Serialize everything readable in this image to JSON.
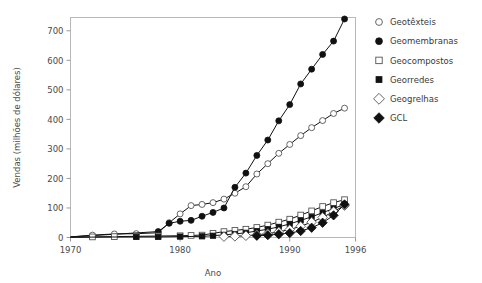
{
  "chart_data": {
    "type": "line",
    "title": "",
    "xlabel": "Ano",
    "ylabel": "Vendas (milhões de dólares)",
    "xlim": [
      1970,
      1996
    ],
    "ylim": [
      0,
      745
    ],
    "xticks": [
      1970,
      1980,
      1990,
      1996
    ],
    "xtick_labels": [
      "1970",
      "1980",
      "1990",
      "1996"
    ],
    "yticks": [
      0,
      100,
      200,
      300,
      400,
      500,
      600,
      700
    ],
    "ytick_labels": [
      "0",
      "100",
      "200",
      "300",
      "400",
      "500",
      "600",
      "700"
    ],
    "grid": false,
    "legend_position": "right",
    "series": [
      {
        "name": "Geotêxteis",
        "marker": "open-circle",
        "x": [
          1970,
          1972,
          1974,
          1976,
          1978,
          1979,
          1980,
          1981,
          1982,
          1983,
          1984,
          1985,
          1986,
          1987,
          1988,
          1989,
          1990,
          1991,
          1992,
          1993,
          1994,
          1995
        ],
        "values": [
          2,
          8,
          12,
          13,
          16,
          50,
          80,
          108,
          112,
          118,
          130,
          150,
          172,
          215,
          250,
          285,
          315,
          345,
          372,
          396,
          420,
          438
        ]
      },
      {
        "name": "Geomembranas",
        "marker": "filled-circle",
        "x": [
          1970,
          1978,
          1979,
          1980,
          1981,
          1982,
          1983,
          1984,
          1985,
          1986,
          1987,
          1988,
          1989,
          1990,
          1991,
          1992,
          1993,
          1994,
          1995
        ],
        "values": [
          2,
          20,
          48,
          55,
          58,
          72,
          85,
          100,
          170,
          218,
          278,
          330,
          395,
          450,
          520,
          570,
          620,
          665,
          740
        ]
      },
      {
        "name": "Geocompostos",
        "marker": "open-square",
        "x": [
          1970,
          1972,
          1974,
          1976,
          1978,
          1980,
          1981,
          1982,
          1983,
          1984,
          1985,
          1986,
          1987,
          1988,
          1989,
          1990,
          1991,
          1992,
          1993,
          1994,
          1995
        ],
        "values": [
          1,
          2,
          3,
          4,
          5,
          6,
          7,
          8,
          14,
          20,
          24,
          28,
          34,
          42,
          52,
          62,
          76,
          90,
          105,
          118,
          128
        ]
      },
      {
        "name": "Georredes",
        "marker": "filled-square",
        "x": [
          1970,
          1976,
          1978,
          1980,
          1982,
          1983,
          1984,
          1985,
          1986,
          1987,
          1988,
          1989,
          1990,
          1991,
          1992,
          1993,
          1994,
          1995
        ],
        "values": [
          1,
          2,
          2,
          3,
          4,
          6,
          9,
          12,
          16,
          22,
          28,
          36,
          46,
          58,
          70,
          84,
          98,
          112
        ]
      },
      {
        "name": "Geogrelhas",
        "marker": "open-diamond",
        "x": [
          1984,
          1985,
          1986,
          1987,
          1988,
          1989,
          1990,
          1991,
          1992,
          1993,
          1994,
          1995
        ],
        "values": [
          3,
          4,
          6,
          9,
          13,
          19,
          27,
          38,
          52,
          68,
          88,
          108
        ]
      },
      {
        "name": "GCL",
        "marker": "filled-diamond",
        "x": [
          1987,
          1988,
          1989,
          1990,
          1991,
          1992,
          1993,
          1994,
          1995
        ],
        "values": [
          6,
          8,
          11,
          15,
          22,
          33,
          50,
          75,
          112
        ]
      }
    ],
    "legend": [
      {
        "label": "Geotêxteis",
        "marker": "open-circle"
      },
      {
        "label": "Geomembranas",
        "marker": "filled-circle"
      },
      {
        "label": "Geocompostos",
        "marker": "open-square"
      },
      {
        "label": "Georredes",
        "marker": "filled-square"
      },
      {
        "label": "Geogrelhas",
        "marker": "open-diamond"
      },
      {
        "label": "GCL",
        "marker": "filled-diamond"
      }
    ],
    "colors": {
      "line": "#111111",
      "marker_fill": "#ffffff",
      "marker_stroke": "#111111",
      "frame": "#b8b8b8",
      "text": "#3a3a3a"
    }
  }
}
